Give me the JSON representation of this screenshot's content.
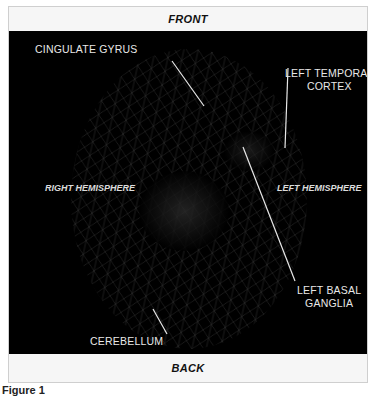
{
  "figure": {
    "top_label": "FRONT",
    "bottom_label": "BACK",
    "caption": "Figure 1",
    "hemispheres": {
      "right": "RIGHT HEMISPHERE",
      "left": "LEFT HEMISPHERE"
    },
    "annotations": [
      {
        "id": "cingulate",
        "label": "CINGULATE GYRUS"
      },
      {
        "id": "temporal",
        "line1": "LEFT TEMPORAL",
        "line2": "CORTEX"
      },
      {
        "id": "basal",
        "line1": "LEFT BASAL",
        "line2": "GANGLIA"
      },
      {
        "id": "cerebellum",
        "label": "CEREBELLUM"
      }
    ],
    "colors": {
      "background": "#000000",
      "band": "#f6f6f6",
      "label": "#e8e8e8",
      "mesh": "#5a5a5a"
    }
  }
}
